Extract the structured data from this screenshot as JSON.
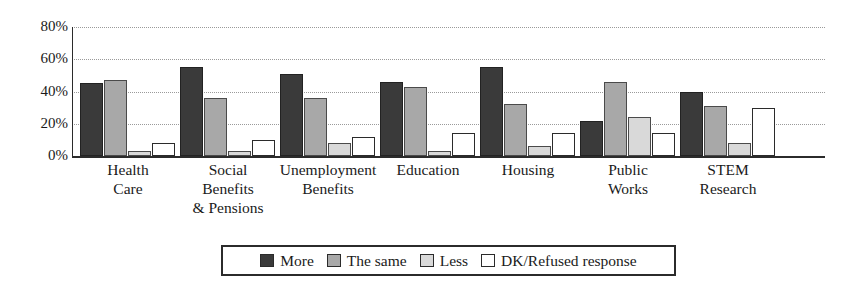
{
  "chart_data": {
    "type": "bar",
    "title": "",
    "subtitle": "",
    "xlabel": "",
    "ylabel": "",
    "ylim": [
      0,
      80
    ],
    "grid": true,
    "grid_axis": "y",
    "legend_position": "bottom",
    "yticks": [
      "0%",
      "20%",
      "40%",
      "60%",
      "80%"
    ],
    "ytick_values": [
      0,
      20,
      40,
      60,
      80
    ],
    "categories": [
      "Health\nCare",
      "Social\nBenefits\n& Pensions",
      "Unemployment\nBenefits",
      "Education",
      "Housing",
      "Public\nWorks",
      "STEM\nResearch"
    ],
    "series": [
      {
        "name": "More",
        "color": "#3a3a3a",
        "values": [
          45,
          55,
          51,
          46,
          55,
          22,
          40
        ]
      },
      {
        "name": "The same",
        "color": "#a8a8a8",
        "values": [
          47,
          36,
          36,
          43,
          32,
          46,
          31
        ]
      },
      {
        "name": "Less",
        "color": "#d9d9d9",
        "values": [
          3,
          3,
          8,
          3,
          6,
          24,
          8
        ]
      },
      {
        "name": "DK/Refused response",
        "color": "#ffffff",
        "values": [
          8,
          10,
          12,
          14,
          14,
          14,
          30
        ]
      }
    ]
  },
  "legend": {
    "items": [
      {
        "label": "More",
        "color": "#3a3a3a"
      },
      {
        "label": "The same",
        "color": "#a8a8a8"
      },
      {
        "label": "Less",
        "color": "#d9d9d9"
      },
      {
        "label": "DK/Refused response",
        "color": "#ffffff"
      }
    ]
  }
}
